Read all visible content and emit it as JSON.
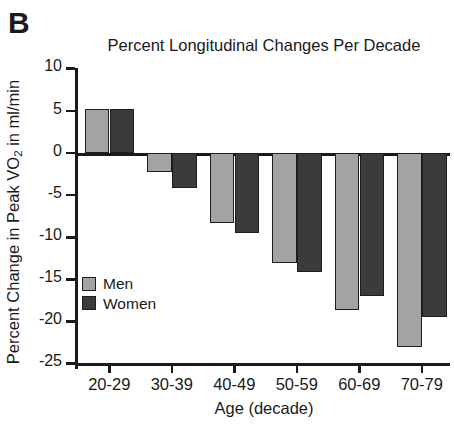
{
  "panel_label": "B",
  "legend": {
    "position": "inside-lower-left",
    "entries": [
      {
        "label": "Men",
        "color": "#a3a3a3"
      },
      {
        "label": "Women",
        "color": "#3b3b3b"
      }
    ]
  },
  "chart_data": {
    "type": "bar",
    "title": "Percent Longitudinal Changes Per Decade",
    "xlabel": "Age (decade)",
    "ylabel": "Percent Change in Peak VO2 in ml/min",
    "ylabel_parts": {
      "before": "Percent Change in Peak VO",
      "sub": "2",
      "after": " in ml/min"
    },
    "categories": [
      "20-29",
      "30-39",
      "40-49",
      "50-59",
      "60-69",
      "70-79"
    ],
    "yticks": [
      10,
      5,
      0,
      -5,
      -10,
      -15,
      -20,
      -25
    ],
    "ytick_labels": [
      "10",
      "5",
      "0",
      "-5",
      "-10",
      "-15",
      "-20",
      "-25"
    ],
    "ylim": [
      -25,
      10
    ],
    "grid": false,
    "zero_line": true,
    "series": [
      {
        "name": "Men",
        "color": "#a3a3a3",
        "values": [
          5.2,
          -2.3,
          -8.3,
          -13.0,
          -18.6,
          -23.0
        ]
      },
      {
        "name": "Women",
        "color": "#3b3b3b",
        "values": [
          5.2,
          -4.1,
          -9.5,
          -14.1,
          -17.0,
          -19.5
        ]
      }
    ]
  }
}
